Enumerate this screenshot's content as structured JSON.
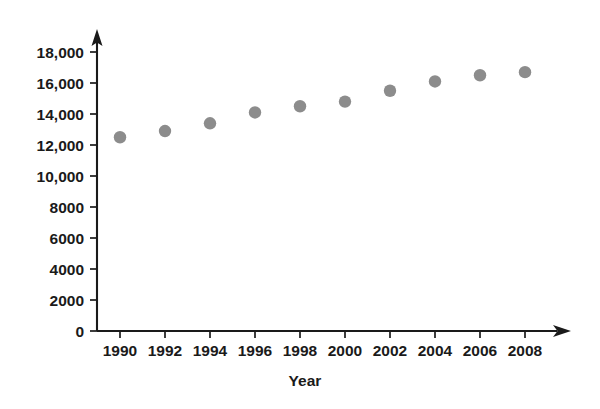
{
  "chart_data": {
    "type": "scatter",
    "title": "",
    "xlabel": "Year",
    "ylabel": "",
    "x": [
      1990,
      1992,
      1994,
      1996,
      1998,
      2000,
      2002,
      2004,
      2006,
      2008
    ],
    "values": [
      12500,
      12900,
      13400,
      14100,
      14500,
      14800,
      15500,
      16100,
      16500,
      16700
    ],
    "categories": [
      "1990",
      "1992",
      "1994",
      "1996",
      "1998",
      "2000",
      "2002",
      "2004",
      "2006",
      "2008"
    ],
    "xtick_labels": [
      "1990",
      "1992",
      "1994",
      "1996",
      "1998",
      "2000",
      "2002",
      "2004",
      "2006",
      "2008"
    ],
    "ytick_labels": [
      "0",
      "2000",
      "4000",
      "6000",
      "8000",
      "10,000",
      "12,000",
      "14,000",
      "16,000",
      "18,000"
    ],
    "ytick_values": [
      0,
      2000,
      4000,
      6000,
      8000,
      10000,
      12000,
      14000,
      16000,
      18000
    ],
    "ylim": [
      0,
      18000
    ],
    "xlim": [
      1989,
      2009
    ],
    "grid": false,
    "legend": null,
    "marker_color": "#8c8c8c",
    "axis_color": "#1a1a1a",
    "background_color": "#ffffff",
    "axis_arrows": true
  },
  "chart": {
    "x_axis_title": "Year"
  }
}
